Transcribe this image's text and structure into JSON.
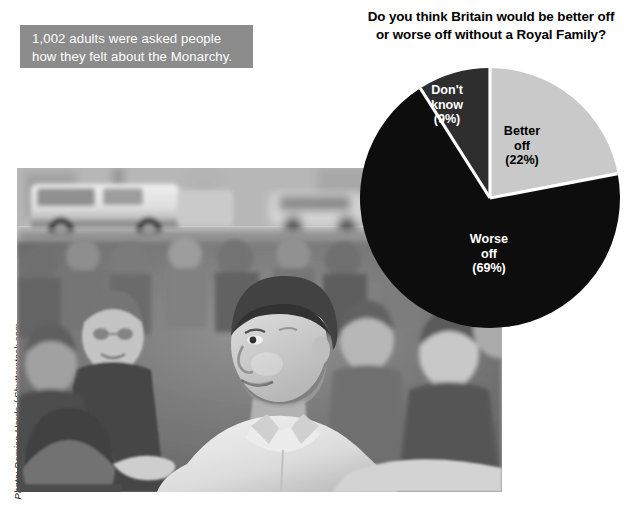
{
  "caption": {
    "lines": [
      "1,002 adults were asked people",
      "how they felt about the Monarchy."
    ],
    "background_color": "#8c8c8c",
    "text_color": "#ffffff"
  },
  "photo": {
    "alt": "Prince William greeting a crowd of people",
    "credit": "Photo: Damian Herde / Shutterstock.com",
    "treatment": "black-and-white"
  },
  "chart_data": {
    "type": "pie",
    "title": "Do you think Britain would be better off or worse off without a Royal Family?",
    "title_lines": [
      "Do you think Britain would be better off",
      "or worse off without a Royal Family?"
    ],
    "categories": [
      "Better off",
      "Worse off",
      "Don't know"
    ],
    "values": [
      22,
      69,
      9
    ],
    "value_unit": "%",
    "sample_size": 1002,
    "legend": "none",
    "start_angle_deg": 0,
    "direction": "clockwise",
    "slices": [
      {
        "label": "Better off",
        "label_lines": [
          "Better",
          "off",
          "(22%)"
        ],
        "value": 22,
        "value_text": "(22%)",
        "color": "#c9c9c9",
        "text_color": "#000000",
        "start_deg": 0,
        "end_deg": 79.2
      },
      {
        "label": "Worse off",
        "label_lines": [
          "Worse",
          "off",
          "(69%)"
        ],
        "value": 69,
        "value_text": "(69%)",
        "color": "#0d0d0d",
        "text_color": "#ffffff",
        "start_deg": 79.2,
        "end_deg": 327.6
      },
      {
        "label": "Don't know",
        "label_lines": [
          "Don't",
          "know",
          "(9%)"
        ],
        "value": 9,
        "value_text": "(9%)",
        "color": "#2e2e2e",
        "text_color": "#ffffff",
        "start_deg": 327.6,
        "end_deg": 360
      }
    ],
    "separator_color": "#ffffff"
  }
}
